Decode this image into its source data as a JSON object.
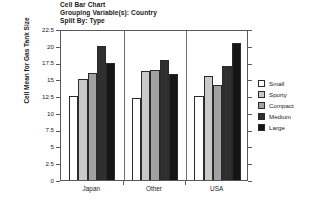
{
  "chart_data": {
    "type": "bar",
    "title": "Cell Bar Chart",
    "subtitle": "Grouping Variable(s): Country",
    "subtitle2": "Split By: Type",
    "xlabel": "",
    "ylabel": "Cell Mean for Gas Tank Size",
    "ylim": [
      0,
      22.5
    ],
    "yticks": [
      0,
      2.5,
      5,
      7.5,
      10,
      12.5,
      15,
      17.5,
      20,
      22.5
    ],
    "ytick_labels": [
      "0",
      "2.5",
      "5",
      "7.5",
      "10",
      "12.5",
      "15",
      "17.5",
      "20",
      "22.5"
    ],
    "grid": false,
    "legend_position": "right",
    "categories": [
      "Japan",
      "Other",
      "USA"
    ],
    "series": [
      {
        "name": "Small",
        "color": "#ffffff",
        "values": [
          12.5,
          12.2,
          12.5
        ]
      },
      {
        "name": "Sporty",
        "color": "#c9c9c9",
        "values": [
          15.0,
          16.2,
          15.5
        ]
      },
      {
        "name": "Compact",
        "color": "#a1a1a1",
        "values": [
          16.0,
          16.4,
          14.2
        ]
      },
      {
        "name": "Medium",
        "color": "#2f2f2f",
        "values": [
          20.0,
          17.9,
          17.0
        ]
      },
      {
        "name": "Large",
        "color": "#151515",
        "values": [
          17.4,
          15.8,
          20.4
        ]
      }
    ]
  }
}
